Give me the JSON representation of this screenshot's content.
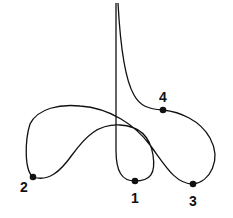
{
  "diagram": {
    "type": "curve-with-labeled-points",
    "stroke_color": "#111111",
    "background": "#ffffff",
    "points": [
      {
        "label": "1",
        "x": 135,
        "y": 181,
        "label_x": 135,
        "label_y": 203
      },
      {
        "label": "2",
        "x": 33,
        "y": 177,
        "label_x": 24,
        "label_y": 192
      },
      {
        "label": "3",
        "x": 193,
        "y": 184,
        "label_x": 193,
        "label_y": 206
      },
      {
        "label": "4",
        "x": 163,
        "y": 110,
        "label_x": 163,
        "label_y": 102
      }
    ]
  }
}
